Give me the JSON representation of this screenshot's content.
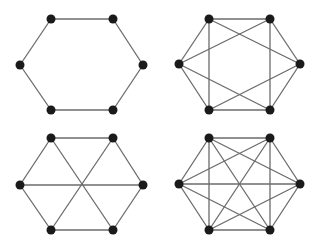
{
  "diagram": {
    "type": "graph-panels",
    "colors": {
      "edge": "#6b6b6b",
      "node": "#1a1a1a",
      "background": "#ffffff"
    },
    "node_radius": 4.5,
    "graphs": [
      {
        "name": "cycle-c6",
        "nodes": [
          [
            51,
            19
          ],
          [
            113,
            19
          ],
          [
            143,
            65
          ],
          [
            113,
            110
          ],
          [
            51,
            110
          ],
          [
            20,
            65
          ]
        ],
        "edges": [
          [
            0,
            1
          ],
          [
            1,
            2
          ],
          [
            2,
            3
          ],
          [
            3,
            4
          ],
          [
            4,
            5
          ],
          [
            5,
            0
          ]
        ]
      },
      {
        "name": "c6-plus-chords",
        "nodes": [
          [
            209,
            19
          ],
          [
            270,
            19
          ],
          [
            300,
            64
          ],
          [
            270,
            110
          ],
          [
            209,
            110
          ],
          [
            179,
            64
          ]
        ],
        "edges": [
          [
            0,
            1
          ],
          [
            1,
            2
          ],
          [
            2,
            3
          ],
          [
            3,
            4
          ],
          [
            4,
            5
          ],
          [
            5,
            0
          ],
          [
            0,
            4
          ],
          [
            1,
            3
          ],
          [
            0,
            2
          ],
          [
            1,
            5
          ],
          [
            5,
            3
          ],
          [
            2,
            4
          ]
        ]
      },
      {
        "name": "c6-plus-diameters",
        "nodes": [
          [
            51,
            138
          ],
          [
            113,
            138
          ],
          [
            143,
            185
          ],
          [
            113,
            230
          ],
          [
            51,
            230
          ],
          [
            20,
            185
          ]
        ],
        "edges": [
          [
            0,
            1
          ],
          [
            1,
            2
          ],
          [
            2,
            3
          ],
          [
            3,
            4
          ],
          [
            4,
            5
          ],
          [
            5,
            0
          ],
          [
            0,
            3
          ],
          [
            1,
            4
          ],
          [
            2,
            5
          ]
        ]
      },
      {
        "name": "complete-k6",
        "nodes": [
          [
            209,
            138
          ],
          [
            270,
            138
          ],
          [
            300,
            184
          ],
          [
            270,
            230
          ],
          [
            209,
            230
          ],
          [
            179,
            184
          ]
        ],
        "edges": [
          [
            0,
            1
          ],
          [
            0,
            2
          ],
          [
            0,
            3
          ],
          [
            0,
            4
          ],
          [
            0,
            5
          ],
          [
            1,
            2
          ],
          [
            1,
            3
          ],
          [
            1,
            4
          ],
          [
            1,
            5
          ],
          [
            2,
            3
          ],
          [
            2,
            4
          ],
          [
            2,
            5
          ],
          [
            3,
            4
          ],
          [
            3,
            5
          ],
          [
            4,
            5
          ]
        ]
      }
    ]
  }
}
